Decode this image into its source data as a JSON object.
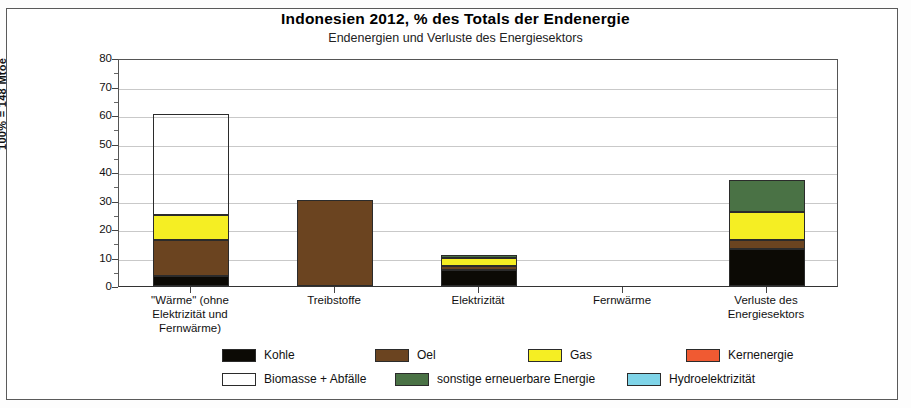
{
  "chart_data": {
    "type": "bar",
    "stacked": true,
    "title": "Indonesien  2012, % des Totals der Endenergie",
    "subtitle": "Endenergien und Verluste des Energiesektors",
    "ylabel": "100% = 148 Mtoe",
    "xlabel": "",
    "ylim": [
      0,
      80
    ],
    "yticks": [
      0,
      10,
      20,
      30,
      40,
      50,
      60,
      70,
      80
    ],
    "ytick_labels": [
      "0",
      "10",
      "20",
      "30",
      "40",
      "50",
      "60",
      "70",
      "80"
    ],
    "yminor_step": 5,
    "grid": true,
    "grid_axis": "y",
    "legend_position": "bottom",
    "categories": [
      "\"Wärme\" (ohne Elektrizität und Fernwärme)",
      "Treibstoffe",
      "Elektrizität",
      "Fernwärme",
      "Verluste des Energiesektors"
    ],
    "category_lines": [
      [
        "\"Wärme\" (ohne",
        "Elektrizität und",
        "Fernwärme)"
      ],
      [
        "Treibstoffe"
      ],
      [
        "Elektrizität"
      ],
      [
        "Fernwärme"
      ],
      [
        "Verluste des",
        "Energiesektors"
      ]
    ],
    "series": [
      {
        "name": "Kohle",
        "color": "#0c0a05",
        "values": [
          3.6,
          0,
          5.5,
          0,
          13.0
        ]
      },
      {
        "name": "Oel",
        "color": "#6b4420",
        "values": [
          12.4,
          30.3,
          1.5,
          0,
          3.3
        ]
      },
      {
        "name": "Gas",
        "color": "#f5ee23",
        "values": [
          8.8,
          0,
          2.8,
          0,
          9.7
        ]
      },
      {
        "name": "Kernenergie",
        "color": "#f05a32",
        "values": [
          0,
          0,
          0,
          0,
          0
        ]
      },
      {
        "name": "Biomasse + Abfälle",
        "color": "#64c martin",
        "values": [
          35.7,
          0,
          0,
          0,
          0
        ]
      },
      {
        "name": "sonstige erneuerbare Energie",
        "color": "#4a7245",
        "values": [
          0,
          0,
          1.1,
          0,
          11.2
        ]
      },
      {
        "name": "Hydroelektrizität",
        "color": "#7fd4e8",
        "values": [
          0,
          0,
          0,
          0,
          0
        ]
      }
    ],
    "totals": [
      60.5,
      30.3,
      10.9,
      0,
      37.2
    ]
  },
  "legend": {
    "row1": [
      {
        "label": "Kohle",
        "color": "#0c0a05"
      },
      {
        "label": "Oel",
        "color": "#6b4420"
      },
      {
        "label": "Gas",
        "color": "#f5ee23"
      },
      {
        "label": "Kernenergie",
        "color": "#f05a32"
      }
    ],
    "row2": [
      {
        "label": "Biomasse + Abfälle",
        "color": "#63c councils"
      },
      {
        "label": "sonstige erneuerbare Energie",
        "color": "#4a7245"
      },
      {
        "label": "Hydroelektrizität",
        "color": "#7fd4e8"
      }
    ]
  },
  "colors": {
    "kohle": "#0c0a05",
    "oel": "#6b4420",
    "gas": "#f5ee23",
    "kernenergie": "#f05a32",
    "biomasse": "#63c83f",
    "sonstige": "#4a7245",
    "hydro": "#7fd4e8",
    "grid": "#c9c9c9",
    "frame": "#5a5a5a"
  }
}
